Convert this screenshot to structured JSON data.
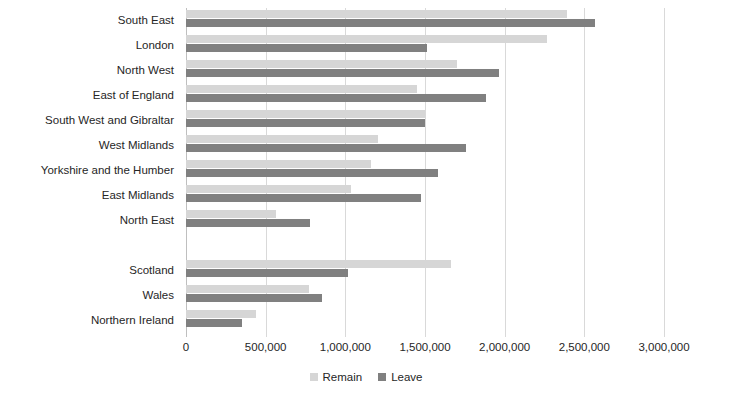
{
  "chart_data": {
    "type": "bar",
    "orientation": "horizontal",
    "title": "",
    "xlabel": "",
    "ylabel": "",
    "xlim": [
      0,
      3000000
    ],
    "xticks": [
      0,
      500000,
      1000000,
      1500000,
      2000000,
      2500000,
      3000000
    ],
    "xtick_labels": [
      "0",
      "500,000",
      "1,000,000",
      "1,500,000",
      "2,000,000",
      "2,500,000",
      "3,000,000"
    ],
    "grid": true,
    "legend_position": "bottom",
    "categories": [
      "South East",
      "London",
      "North West",
      "East of England",
      "South West and Gibraltar",
      "West Midlands",
      "Yorkshire and the Humber",
      "East Midlands",
      "North East",
      "",
      "Scotland",
      "Wales",
      "Northern Ireland"
    ],
    "series": [
      {
        "name": "Remain",
        "color": "#d6d6d6",
        "values": [
          2391718,
          2263519,
          1699020,
          1448616,
          1503019,
          1207175,
          1158298,
          1033036,
          562595,
          null,
          1661191,
          772347,
          440707
        ]
      },
      {
        "name": "Leave",
        "color": "#808080",
        "values": [
          2567965,
          1513232,
          1966925,
          1880367,
          1503019,
          1755687,
          1580937,
          1475479,
          778103,
          null,
          1018322,
          854572,
          349442
        ]
      }
    ]
  },
  "legend": {
    "items": [
      {
        "label": "Remain",
        "swatch": "remain"
      },
      {
        "label": "Leave",
        "swatch": "leave"
      }
    ]
  },
  "colors": {
    "remain": "#d6d6d6",
    "leave": "#808080",
    "grid": "#d9d9d9",
    "text": "#262626",
    "background": "#ffffff"
  }
}
